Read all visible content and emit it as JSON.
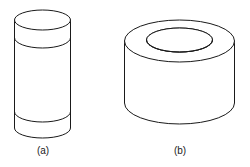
{
  "figure": {
    "background_color": "#ffffff",
    "line_color": "#1a1a1a",
    "fill_color": "#ffffff",
    "parts": [
      {
        "id": "a",
        "caption": "(a)",
        "shape_name": "banded-cylinder",
        "description": "Tall upright solid cylinder with two circumferential bands",
        "geometry": {
          "center_x": 42.5,
          "left_x": 14.5,
          "right_x": 70.5,
          "radius_x": 28,
          "radius_y": 10,
          "top_y": 20,
          "bottom_y": 128,
          "band_lines_y": [
            38,
            112
          ]
        }
      },
      {
        "id": "b",
        "caption": "(b)",
        "shape_name": "hollow-cylinder",
        "description": "Short hollow cylinder (tube / annulus) with visible circular bore",
        "geometry": {
          "center_x": 179.5,
          "left_x": 124.5,
          "right_x": 234.5,
          "outer_radius_x": 55,
          "outer_radius_y": 21,
          "inner_radius_x": 33,
          "inner_radius_y": 12,
          "top_y": 41,
          "bottom_y": 103,
          "bore_depth_y": 10
        }
      }
    ]
  }
}
